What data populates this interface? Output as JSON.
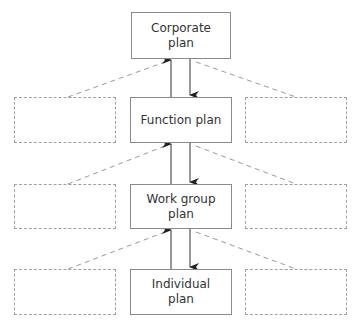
{
  "diagram": {
    "type": "hierarchy",
    "nodes": [
      {
        "id": "corporate",
        "label": "Corporate\nplan"
      },
      {
        "id": "function",
        "label": "Function plan"
      },
      {
        "id": "workgroup",
        "label": "Work group\nplan"
      },
      {
        "id": "individual",
        "label": "Individual\nplan"
      }
    ],
    "side_boxes": {
      "left": [
        "",
        "",
        ""
      ],
      "right": [
        "",
        "",
        ""
      ]
    },
    "edges": [
      {
        "from": "function",
        "to": "corporate",
        "direction": "up"
      },
      {
        "from": "corporate",
        "to": "function",
        "direction": "down"
      },
      {
        "from": "workgroup",
        "to": "function",
        "direction": "up"
      },
      {
        "from": "function",
        "to": "workgroup",
        "direction": "down"
      },
      {
        "from": "individual",
        "to": "workgroup",
        "direction": "up"
      },
      {
        "from": "workgroup",
        "to": "individual",
        "direction": "down"
      }
    ],
    "colors": {
      "box_border": "#8a8a8a",
      "dashed": "#a0a0a0",
      "arrow": "#333333",
      "text": "#333333"
    }
  }
}
